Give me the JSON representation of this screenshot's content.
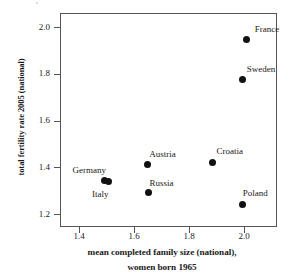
{
  "chart_data": {
    "type": "scatter",
    "title": "",
    "xlabel": "mean completed family size (national),",
    "xlabel_line2": "women born 1965",
    "ylabel": "total fertility rate 2005 (national)",
    "xlim": [
      1.33,
      2.12
    ],
    "ylim": [
      1.145,
      2.06
    ],
    "xticks": [
      "1.4",
      "1.6",
      "1.8",
      "2.0"
    ],
    "xtick_values": [
      1.4,
      1.6,
      1.8,
      2.0
    ],
    "yticks": [
      "1.2",
      "1.4",
      "1.6",
      "1.8",
      "2.0"
    ],
    "ytick_values": [
      1.2,
      1.4,
      1.6,
      1.8,
      2.0
    ],
    "grid": false,
    "legend": "none",
    "marker": "filled-circle",
    "marker_color": "#111111",
    "points": [
      {
        "label": "France",
        "x": 2.01,
        "y": 1.945,
        "label_dx": 8,
        "label_dy": -15
      },
      {
        "label": "Sweden",
        "x": 1.995,
        "y": 1.775,
        "label_dx": 4,
        "label_dy": -15
      },
      {
        "label": "Croatia",
        "x": 1.885,
        "y": 1.422,
        "label_dx": 4,
        "label_dy": -15
      },
      {
        "label": "Austria",
        "x": 1.648,
        "y": 1.412,
        "label_dx": 2,
        "label_dy": -15
      },
      {
        "label": "Germany",
        "x": 1.492,
        "y": 1.345,
        "label_dx": -32,
        "label_dy": -14
      },
      {
        "label": "Italy",
        "x": 1.505,
        "y": 1.338,
        "label_dx": -16,
        "label_dy": 8
      },
      {
        "label": "Russia",
        "x": 1.652,
        "y": 1.292,
        "label_dx": 1,
        "label_dy": -14
      },
      {
        "label": "Poland",
        "x": 1.995,
        "y": 1.243,
        "label_dx": 0,
        "label_dy": -15
      }
    ]
  }
}
